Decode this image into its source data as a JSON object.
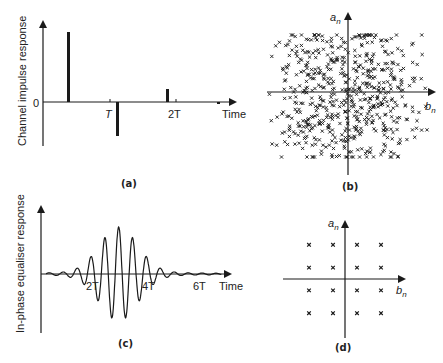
{
  "chart_data": [
    {
      "panel": "(a)",
      "type": "bar",
      "title": "",
      "caption": "(a)",
      "ylabel": "Channel impulse response",
      "xlabel": "Time",
      "y_zero_label": "0",
      "x_ticks": [
        {
          "label": "T",
          "t": 1.0
        },
        {
          "label": "2T",
          "t": 2.0
        }
      ],
      "impulses": [
        {
          "t": 0.37,
          "value": 1.0
        },
        {
          "t": 1.12,
          "value": -0.5
        },
        {
          "t": 1.86,
          "value": 0.18
        },
        {
          "t": 2.62,
          "value": -0.03
        }
      ],
      "grid": false
    },
    {
      "panel": "(b)",
      "type": "scatter",
      "caption": "(b)",
      "xlabel": "b_n",
      "ylabel": "a_n",
      "description": "Noisy received constellation: dense cloud of x markers scattered around origin",
      "marker": "x",
      "xlim": [
        -1.2,
        1.2
      ],
      "ylim": [
        -1.2,
        1.2
      ],
      "approx_point_count": 600,
      "grid": false
    },
    {
      "panel": "(c)",
      "type": "line",
      "caption": "(c)",
      "ylabel": "In-phase equaliser response",
      "xlabel": "Time",
      "x_ticks": [
        {
          "label": "2T",
          "t": 2
        },
        {
          "label": "4T",
          "t": 4
        },
        {
          "label": "6T",
          "t": 6
        }
      ],
      "description": "Oscillating equaliser impulse response peaking near t=2.5T, decaying toward 0 and 6T",
      "peak_time": 2.5,
      "peak_value": 1.0,
      "min_value": -0.95,
      "grid": false
    },
    {
      "panel": "(d)",
      "type": "scatter",
      "caption": "(d)",
      "xlabel": "b_n",
      "ylabel": "a_n",
      "description": "Equalised 16-QAM constellation, 4x4 grid of x markers",
      "marker": "x",
      "points": [
        [
          -3,
          3
        ],
        [
          -1,
          3
        ],
        [
          1,
          3
        ],
        [
          3,
          3
        ],
        [
          -3,
          1
        ],
        [
          -1,
          1
        ],
        [
          1,
          1
        ],
        [
          3,
          1
        ],
        [
          -3,
          -1
        ],
        [
          -1,
          -1
        ],
        [
          1,
          -1
        ],
        [
          3,
          -1
        ],
        [
          -3,
          -3
        ],
        [
          -1,
          -3
        ],
        [
          1,
          -3
        ],
        [
          3,
          -3
        ]
      ],
      "grid": false
    }
  ],
  "labels": {
    "a_ylabel": "Channel impulse response",
    "a_zero": "0",
    "a_T": "T",
    "a_2T": "2T",
    "a_time": "Time",
    "a_caption": "(a)",
    "b_an": "a",
    "b_bn": "b",
    "b_sub": "n",
    "b_caption": "(b)",
    "c_ylabel": "In-phase equaliser response",
    "c_2T": "2T",
    "c_4T": "4T",
    "c_6T": "6T",
    "c_time": "Time",
    "c_caption": "(c)",
    "d_caption": "(d)"
  },
  "colors": {
    "ink": "#1a1a1a",
    "background": "#ffffff"
  }
}
